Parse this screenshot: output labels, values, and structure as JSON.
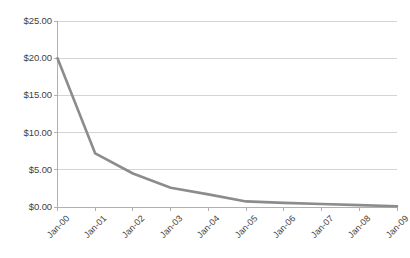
{
  "chart_data": {
    "type": "line",
    "title": "",
    "subtitle": "",
    "xlabel": "",
    "ylabel": "",
    "categories": [
      "Jan-00",
      "Jan-01",
      "Jan-02",
      "Jan-03",
      "Jan-04",
      "Jan-05",
      "Jan-06",
      "Jan-07",
      "Jan-08",
      "Jan-09"
    ],
    "values": [
      20.0,
      7.2,
      4.5,
      2.6,
      1.7,
      0.75,
      0.55,
      0.4,
      0.25,
      0.1
    ],
    "series": [
      {
        "name": "",
        "values": [
          20.0,
          7.2,
          4.5,
          2.6,
          1.7,
          0.75,
          0.55,
          0.4,
          0.25,
          0.1
        ]
      }
    ],
    "ylim": [
      0,
      25
    ],
    "ytick_values": [
      0,
      5,
      10,
      15,
      20,
      25
    ],
    "ytick_labels": [
      "$0.00",
      "$5.00",
      "$10.00",
      "$15.00",
      "$20.00",
      "$25.00"
    ],
    "grid": true,
    "grid_axis": "y",
    "legend": false,
    "legend_position": "none",
    "annotations": [],
    "line_color": "#8c8c8c",
    "grid_color": "#d4d4d4",
    "axis_color": "#b0b0b0",
    "background_color": "#ffffff",
    "text_color": "#3f3f3f",
    "xtick_rotation": -45,
    "markers": false
  }
}
